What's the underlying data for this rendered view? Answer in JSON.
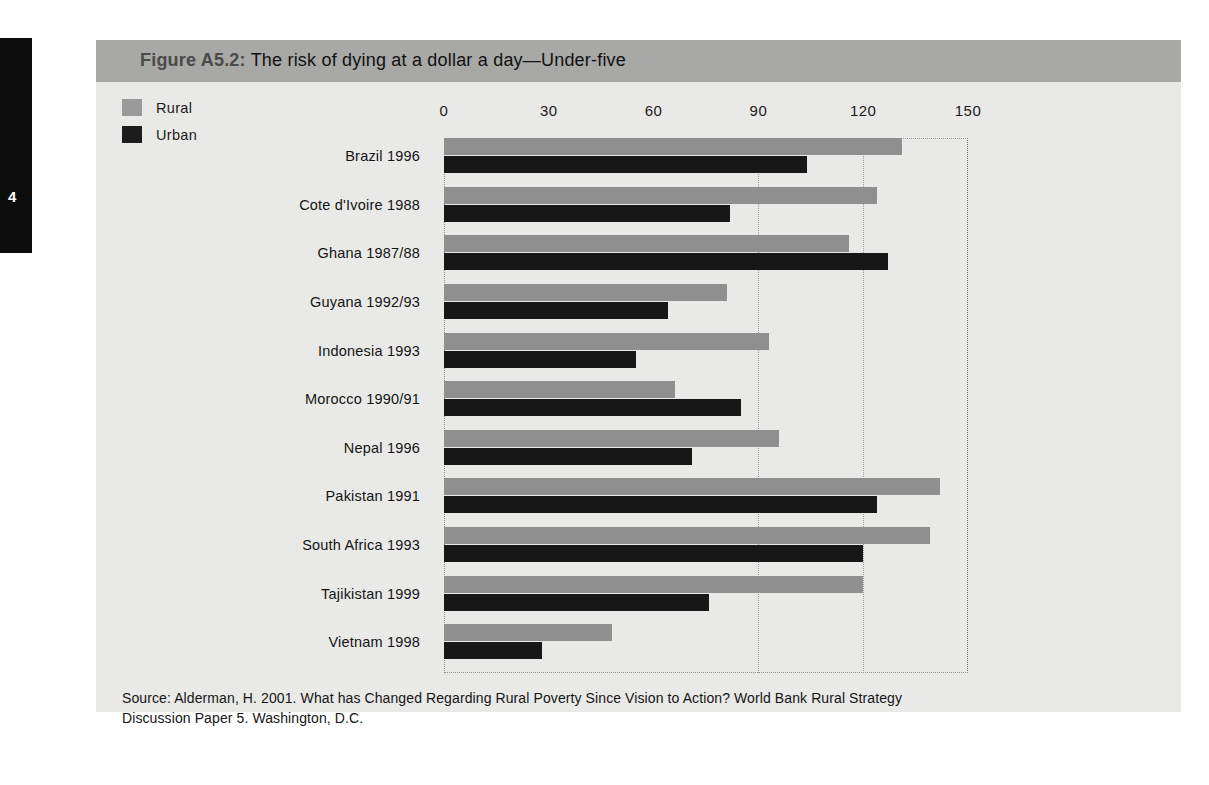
{
  "page": {
    "tab_number": "4"
  },
  "figure": {
    "number": "Figure A5.2:",
    "caption": "The risk of dying at a dollar a day—Under-five",
    "source_line1": "Source: Alderman, H. 2001. What has Changed Regarding Rural Poverty Since Vision to Action? World Bank Rural Strategy",
    "source_line2": "Discussion Paper 5. Washington, D.C."
  },
  "legend": {
    "position": "top-left",
    "items": [
      {
        "label": "Rural",
        "color": "#8f8f8f",
        "swatch_name": "legend-swatch-rural"
      },
      {
        "label": "Urban",
        "color": "#171717",
        "swatch_name": "legend-swatch-urban"
      }
    ]
  },
  "chart_data": {
    "type": "bar",
    "orientation": "horizontal",
    "title": "Figure A5.2: The risk of dying at a dollar a day—Under-five",
    "xlabel": "",
    "ylabel": "",
    "xlim": [
      0,
      150
    ],
    "xticks": [
      0,
      30,
      60,
      90,
      120,
      150
    ],
    "xtick_labels": [
      "0",
      "30",
      "60",
      "90",
      "120",
      "150"
    ],
    "grid": "vertical dotted at 90 and 120",
    "gridlines": [
      90,
      120
    ],
    "legend_entries": [
      "Rural",
      "Urban"
    ],
    "categories": [
      "Brazil 1996",
      "Cote d'Ivoire 1988",
      "Ghana 1987/88",
      "Guyana 1992/93",
      "Indonesia 1993",
      "Morocco 1990/91",
      "Nepal 1996",
      "Pakistan 1991",
      "South Africa 1993",
      "Tajikistan 1999",
      "Vietnam 1998"
    ],
    "series": [
      {
        "name": "Rural",
        "color": "#8f8f8f",
        "values": [
          131,
          124,
          116,
          81,
          93,
          66,
          96,
          142,
          139,
          120,
          48
        ]
      },
      {
        "name": "Urban",
        "color": "#171717",
        "values": [
          104,
          82,
          127,
          64,
          55,
          85,
          71,
          124,
          120,
          76,
          28
        ]
      }
    ]
  }
}
